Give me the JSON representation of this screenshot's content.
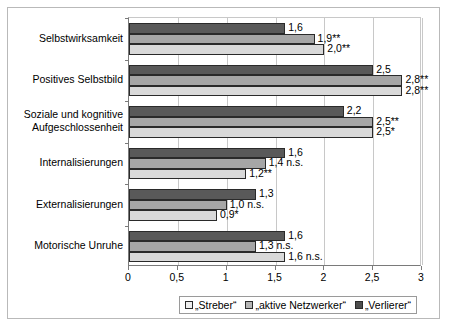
{
  "chart_data": {
    "type": "bar",
    "orientation": "horizontal",
    "title": "",
    "xlabel": "",
    "ylabel": "",
    "xlim": [
      0,
      3
    ],
    "xticks": [
      "0",
      "0,5",
      "1",
      "1,5",
      "2",
      "2,5",
      "3"
    ],
    "xtick_values": [
      0,
      0.5,
      1,
      1.5,
      2,
      2.5,
      3
    ],
    "grid": true,
    "legend_position": "bottom",
    "categories": [
      "Selbstwirksamkeit",
      "Positives Selbstbild",
      "Soziale und kognitive\nAufgeschlossenheit",
      "Internalisierungen",
      "Externalisierungen",
      "Motorische Unruhe"
    ],
    "series": [
      {
        "name": "„Verlierer“",
        "color": "#595959",
        "values": [
          1.6,
          2.5,
          2.2,
          1.6,
          1.3,
          1.6
        ],
        "labels": [
          "1,6",
          "2,5",
          "2,2",
          "1,6",
          "1,3",
          "1,6"
        ]
      },
      {
        "name": "„aktive Netzwerker“",
        "color": "#a6a6a6",
        "values": [
          1.9,
          2.8,
          2.5,
          1.4,
          1.0,
          1.3
        ],
        "labels": [
          "1,9**",
          "2,8**",
          "2,5**",
          "1,4 n.s.",
          "1,0 n.s.",
          "1,3 n.s."
        ]
      },
      {
        "name": "„Streber“",
        "color": "#d9d9d9",
        "values": [
          2.0,
          2.8,
          2.5,
          1.2,
          0.9,
          1.6
        ],
        "labels": [
          "2,0**",
          "2,8**",
          "2,5*",
          "1,2**",
          "0,9*",
          "1,6 n.s."
        ]
      }
    ]
  },
  "legend": {
    "items": [
      {
        "label": "„Streber“",
        "swatch": "s-streber"
      },
      {
        "label": "„aktive Netzwerker“",
        "swatch": "s-netzwerker"
      },
      {
        "label": "„Verlierer“",
        "swatch": "s-verlierer"
      }
    ]
  }
}
